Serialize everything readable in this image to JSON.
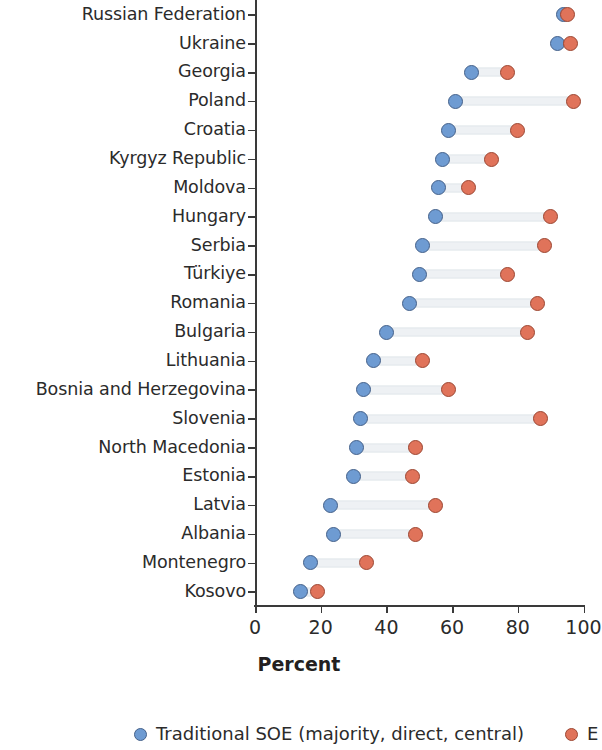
{
  "chart_data": {
    "type": "scatter",
    "subtype": "dumbbell",
    "title": "",
    "xlabel": "Percent",
    "ylabel": "",
    "xlim": [
      0,
      100
    ],
    "xticks": [
      0,
      20,
      40,
      60,
      80,
      100
    ],
    "xtick_labels": [
      "0",
      "20",
      "40",
      "60",
      "80",
      "100"
    ],
    "grid": false,
    "legend_position": "bottom",
    "categories": [
      "Russian Federation",
      "Ukraine",
      "Georgia",
      "Poland",
      "Croatia",
      "Kyrgyz Republic",
      "Moldova",
      "Hungary",
      "Serbia",
      "Türkiye",
      "Romania",
      "Bulgaria",
      "Lithuania",
      "Bosnia and Herzegovina",
      "Slovenia",
      "North Macedonia",
      "Estonia",
      "Latvia",
      "Albania",
      "Montenegro",
      "Kosovo"
    ],
    "series": [
      {
        "name": "Traditional SOE (majority, direct, central)",
        "color": "#6e9bd2",
        "values": [
          94,
          92,
          66,
          61,
          59,
          57,
          56,
          55,
          51,
          50,
          47,
          40,
          36,
          33,
          32,
          31,
          30,
          23,
          24,
          17,
          14
        ]
      },
      {
        "name": "E",
        "color": "#e0735a",
        "values": [
          95,
          96,
          77,
          97,
          80,
          72,
          65,
          90,
          88,
          77,
          86,
          83,
          51,
          59,
          87,
          49,
          48,
          55,
          49,
          34,
          19
        ]
      }
    ]
  },
  "legend": {
    "items": [
      {
        "label": "Traditional SOE (majority, direct, central)",
        "marker": "blue-circle-marker"
      },
      {
        "label": "E",
        "marker": "red-circle-marker"
      }
    ]
  },
  "axis": {
    "x_title": "Percent"
  }
}
